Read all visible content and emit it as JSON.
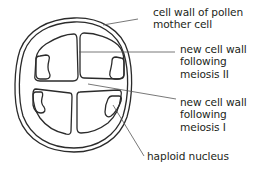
{
  "diagram": {
    "title": "",
    "labels": [
      {
        "id": "cell-wall-pollen-mother-cell",
        "lines": [
          "cell wall of pollen",
          "mother cell"
        ]
      },
      {
        "id": "new-cell-wall-meiosis-ii",
        "lines": [
          "new cell wall",
          "following",
          "meiosis II"
        ]
      },
      {
        "id": "new-cell-wall-meiosis-i",
        "lines": [
          "new cell wall",
          "following",
          "meiosis I"
        ]
      },
      {
        "id": "haploid-nucleus",
        "lines": [
          "haploid nucleus"
        ]
      }
    ],
    "colors": {
      "stroke": "#2b2b2b",
      "leader": "#555555",
      "text": "#231f20",
      "background": "#ffffff"
    }
  }
}
